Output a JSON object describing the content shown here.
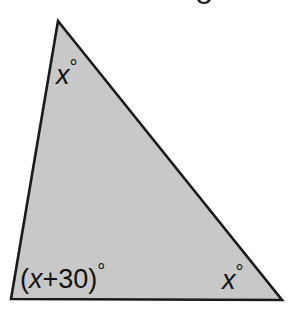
{
  "diagram": {
    "type": "triangle",
    "fill_color": "#c8c8c8",
    "stroke_color": "#1a1a1a",
    "vertices": {
      "top": [
        58,
        21
      ],
      "bottom_left": [
        11,
        299
      ],
      "bottom_right": [
        282,
        300
      ]
    },
    "angles": {
      "top": {
        "var": "x",
        "suffix": "°",
        "full": "x°"
      },
      "bottom_left": {
        "prefix": "(",
        "var": "x",
        "rest": "+30)",
        "suffix": "°",
        "full": "(x+30)°"
      },
      "bottom_right": {
        "var": "x",
        "suffix": "°",
        "full": "x°"
      }
    }
  }
}
